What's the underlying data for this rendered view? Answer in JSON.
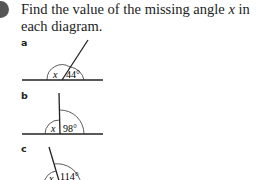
{
  "question": {
    "prefix": "Find the value of the missing angle ",
    "variable": "x",
    "suffix": " in each diagram."
  },
  "parts": [
    {
      "label": "a",
      "unknown": "x",
      "known_angle": "44°"
    },
    {
      "label": "b",
      "unknown": "x",
      "known_angle": "98°"
    },
    {
      "label": "c",
      "unknown": "x",
      "known_angle": "114°"
    }
  ],
  "colors": {
    "line": "#222222",
    "bullet": "#555555"
  }
}
